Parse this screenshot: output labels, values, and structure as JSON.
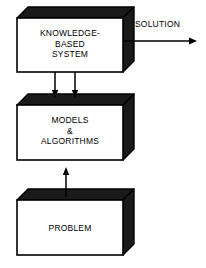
{
  "diagram": {
    "colors": {
      "background": "#ffffff",
      "box_face": "#ffffff",
      "box_extrusion": "#1a1a1a",
      "outline": "#000000",
      "text": "#000000"
    },
    "boxes": [
      {
        "id": "knowledge-based-system",
        "label": "KNOWLEDGE-\nBASED\nSYSTEM",
        "x": 17,
        "y": 18,
        "width": 106,
        "height": 54,
        "depth": 11
      },
      {
        "id": "models-algorithms",
        "label": "MODELS\n&\nALGORITHMS",
        "x": 17,
        "y": 105,
        "width": 106,
        "height": 55,
        "depth": 11
      },
      {
        "id": "problem",
        "label": "PROBLEM",
        "x": 17,
        "y": 200,
        "width": 106,
        "height": 55,
        "depth": 11
      }
    ],
    "connectors": [
      {
        "id": "solution-output",
        "label": "SOLUTION",
        "direction": "right",
        "x1": 123,
        "y1": 41,
        "x2": 197,
        "y2": 41,
        "label_x": 135,
        "label_y": 19
      },
      {
        "id": "kbs-to-models-left",
        "label": "",
        "direction": "down",
        "x1": 55,
        "y1": 72,
        "x2": 55,
        "y2": 98,
        "label_x": 0,
        "label_y": 0
      },
      {
        "id": "kbs-to-models-right",
        "label": "",
        "direction": "down",
        "x1": 75,
        "y1": 72,
        "x2": 75,
        "y2": 98,
        "label_x": 0,
        "label_y": 0
      },
      {
        "id": "problem-to-models",
        "label": "",
        "direction": "up",
        "x1": 66,
        "y1": 197,
        "x2": 66,
        "y2": 167,
        "label_x": 0,
        "label_y": 0
      }
    ]
  }
}
